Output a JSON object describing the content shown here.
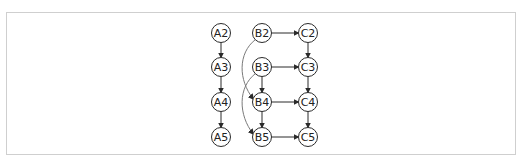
{
  "diagram": {
    "type": "dependency-graph",
    "nodes": [
      {
        "id": "A2",
        "label": "A2",
        "x": 221,
        "y": 33
      },
      {
        "id": "A3",
        "label": "A3",
        "x": 221,
        "y": 67
      },
      {
        "id": "A4",
        "label": "A4",
        "x": 221,
        "y": 102
      },
      {
        "id": "A5",
        "label": "A5",
        "x": 221,
        "y": 137
      },
      {
        "id": "B2",
        "label": "B2",
        "x": 262,
        "y": 33
      },
      {
        "id": "B3",
        "label": "B3",
        "x": 262,
        "y": 67
      },
      {
        "id": "B4",
        "label": "B4",
        "x": 262,
        "y": 102
      },
      {
        "id": "B5",
        "label": "B5",
        "x": 262,
        "y": 137
      },
      {
        "id": "C2",
        "label": "C2",
        "x": 308,
        "y": 33
      },
      {
        "id": "C3",
        "label": "C3",
        "x": 308,
        "y": 67
      },
      {
        "id": "C4",
        "label": "C4",
        "x": 308,
        "y": 102
      },
      {
        "id": "C5",
        "label": "C5",
        "x": 308,
        "y": 137
      }
    ],
    "edges": [
      {
        "from": "A2",
        "to": "A3",
        "style": "straight"
      },
      {
        "from": "A3",
        "to": "A4",
        "style": "straight"
      },
      {
        "from": "A4",
        "to": "A5",
        "style": "straight"
      },
      {
        "from": "B2",
        "to": "C2",
        "style": "straight"
      },
      {
        "from": "B3",
        "to": "C3",
        "style": "straight"
      },
      {
        "from": "B4",
        "to": "C4",
        "style": "straight"
      },
      {
        "from": "B5",
        "to": "C5",
        "style": "straight"
      },
      {
        "from": "C2",
        "to": "C3",
        "style": "straight"
      },
      {
        "from": "C3",
        "to": "C4",
        "style": "straight"
      },
      {
        "from": "C4",
        "to": "C5",
        "style": "straight"
      },
      {
        "from": "B3",
        "to": "B4",
        "style": "straight"
      },
      {
        "from": "B4",
        "to": "B5",
        "style": "straight"
      },
      {
        "from": "B2",
        "to": "B4",
        "style": "curved"
      },
      {
        "from": "B3",
        "to": "B5",
        "style": "curved"
      }
    ],
    "colors": {
      "stroke": "#2a2a2a",
      "curve": "#7a7a7a",
      "frame": "#cfcfcf"
    }
  }
}
